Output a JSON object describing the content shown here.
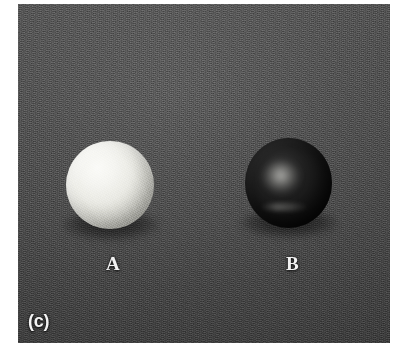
{
  "figure": {
    "panel_letter": "(c)",
    "kind": "grayscale-photograph",
    "background_color": "#4b4b4b",
    "page_background_color": "#ffffff"
  },
  "photo": {
    "subject": "two spheres resting on a uniform gray backdrop",
    "specimens": [
      {
        "label": "A",
        "description": "matte light-colored sphere",
        "surface": "matte",
        "color": "#eaeae4",
        "position": "left"
      },
      {
        "label": "B",
        "description": "glossy dark sphere with specular highlight",
        "surface": "glossy",
        "color": "#161616",
        "position": "right"
      }
    ]
  },
  "labels": {
    "specimen_a": "A",
    "specimen_b": "B",
    "panel": "(c)"
  }
}
